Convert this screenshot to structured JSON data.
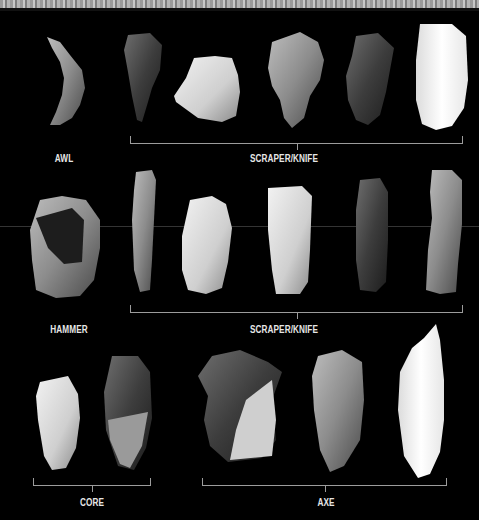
{
  "figure": {
    "background": "#000000",
    "rows": [
      {
        "groups": [
          {
            "label": "AWL",
            "count": 1
          },
          {
            "label": "SCRAPER/KNIFE",
            "count": 5
          }
        ]
      },
      {
        "groups": [
          {
            "label": "HAMMER",
            "count": 1
          },
          {
            "label": "SCRAPER/KNIFE",
            "count": 5
          }
        ]
      },
      {
        "groups": [
          {
            "label": "CORE",
            "count": 2
          },
          {
            "label": "AXE",
            "count": 3
          }
        ]
      }
    ]
  },
  "labels": {
    "awl": "AWL",
    "scraper_knife_1": "SCRAPER/KNIFE",
    "hammer": "HAMMER",
    "scraper_knife_2": "SCRAPER/KNIFE",
    "core": "CORE",
    "axe": "AXE"
  }
}
